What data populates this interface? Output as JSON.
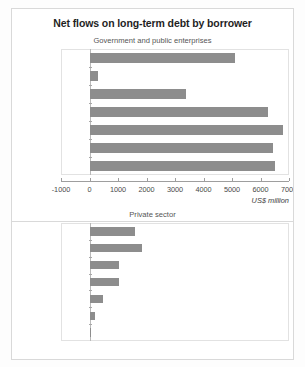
{
  "chart_data": [
    {
      "type": "bar",
      "orientation": "horizontal",
      "title": "Net flows on long-term debt by borrower",
      "subtitle": "Government and public enterprises",
      "categories": [
        "1996",
        "1995",
        "1994",
        "1993",
        "1992",
        "1991",
        "1990"
      ],
      "values": [
        5100,
        300,
        3400,
        6250,
        6800,
        6450,
        6500
      ],
      "xlabel": "US$ million",
      "ylabel": "",
      "xticks": [
        "-1000",
        "0",
        "1000",
        "2000",
        "3000",
        "4000",
        "5000",
        "6000",
        "7000"
      ],
      "xtick_values": [
        -1000,
        0,
        1000,
        2000,
        3000,
        4000,
        5000,
        6000,
        7000
      ],
      "xlim": [
        -1000,
        7000
      ],
      "grid": false,
      "legend": "none",
      "bar_color": "#8d8d8d"
    },
    {
      "type": "bar",
      "orientation": "horizontal",
      "title": "",
      "subtitle": "Private sector",
      "categories": [
        "1996",
        "1995",
        "1994",
        "1993",
        "1992",
        "1991",
        "1990"
      ],
      "values": [
        1600,
        1850,
        1050,
        1050,
        460,
        190,
        40
      ],
      "xlabel": "",
      "ylabel": "",
      "xticks": [],
      "xtick_values": [],
      "xlim": [
        -1000,
        7000
      ],
      "grid": false,
      "legend": "none",
      "bar_color": "#8d8d8d"
    }
  ],
  "figure": {
    "title": "Net flows on long-term debt by borrower",
    "panel1": {
      "subtitle": "Government and public enterprises",
      "units_label": "US$ million",
      "years": [
        "1996",
        "1995",
        "1994",
        "1993",
        "1992",
        "1991",
        "1990"
      ],
      "xticks": [
        "-1000",
        "0",
        "1000",
        "2000",
        "3000",
        "4000",
        "5000",
        "6000",
        "7000"
      ]
    },
    "panel2": {
      "subtitle": "Private sector",
      "years": [
        "1996",
        "1995",
        "1994",
        "1993",
        "1992",
        "1991",
        "1990"
      ]
    },
    "colors": {
      "bar": "#8d8d8d",
      "frame": "#d9d9d9",
      "plot_border": "#e2e2e2",
      "text": "#3a3a3a"
    }
  }
}
